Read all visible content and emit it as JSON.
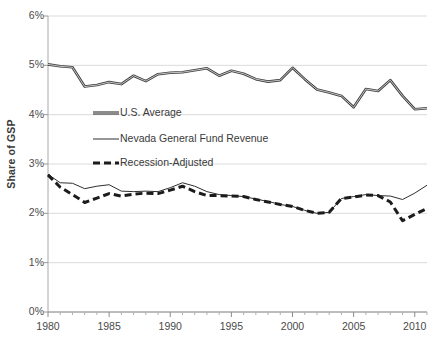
{
  "chart_data": {
    "type": "line",
    "title": "",
    "xlabel": "",
    "ylabel": "Share of GSP",
    "xlim": [
      1980,
      2011
    ],
    "ylim": [
      0,
      6
    ],
    "grid": true,
    "legend_position": "inside-upper-left",
    "y_tick_labels": [
      "0%",
      "1%",
      "2%",
      "3%",
      "4%",
      "5%",
      "6%"
    ],
    "y_tick_values": [
      0,
      1,
      2,
      3,
      4,
      5,
      6
    ],
    "x_tick_labels": [
      "1980",
      "1985",
      "1990",
      "1995",
      "2000",
      "2005",
      "2010"
    ],
    "x_tick_values": [
      1980,
      1985,
      1990,
      1995,
      2000,
      2005,
      2010
    ],
    "x": [
      1980,
      1981,
      1982,
      1983,
      1984,
      1985,
      1986,
      1987,
      1988,
      1989,
      1990,
      1991,
      1992,
      1993,
      1994,
      1995,
      1996,
      1997,
      1998,
      1999,
      2000,
      2001,
      2002,
      2003,
      2004,
      2005,
      2006,
      2007,
      2008,
      2009,
      2010,
      2011
    ],
    "series": [
      {
        "name": "U.S. Average",
        "style": "thick-solid",
        "color": "#404040",
        "values": [
          5.02,
          4.98,
          4.96,
          4.57,
          4.6,
          4.66,
          4.62,
          4.79,
          4.68,
          4.82,
          4.85,
          4.86,
          4.9,
          4.94,
          4.79,
          4.89,
          4.83,
          4.72,
          4.67,
          4.7,
          4.95,
          4.72,
          4.51,
          4.45,
          4.38,
          4.15,
          4.52,
          4.48,
          4.7,
          4.38,
          4.11,
          4.13
        ]
      },
      {
        "name": "Nevada General Fund Revenue",
        "style": "thin-solid",
        "color": "#2f2f2f",
        "values": [
          2.79,
          2.62,
          2.61,
          2.5,
          2.55,
          2.58,
          2.45,
          2.44,
          2.45,
          2.44,
          2.52,
          2.62,
          2.55,
          2.44,
          2.38,
          2.36,
          2.34,
          2.29,
          2.24,
          2.18,
          2.14,
          2.06,
          2.0,
          2.02,
          2.3,
          2.34,
          2.38,
          2.36,
          2.35,
          2.28,
          2.41,
          2.57
        ]
      },
      {
        "name": "Recession-Adjusted",
        "style": "thick-dashed",
        "color": "#1c1c1c",
        "values": [
          2.78,
          2.53,
          2.38,
          2.22,
          2.31,
          2.4,
          2.35,
          2.39,
          2.41,
          2.4,
          2.47,
          2.55,
          2.44,
          2.36,
          2.36,
          2.35,
          2.34,
          2.28,
          2.23,
          2.18,
          2.14,
          2.06,
          2.0,
          2.02,
          2.3,
          2.33,
          2.37,
          2.36,
          2.23,
          1.85,
          1.98,
          2.1
        ]
      }
    ]
  }
}
